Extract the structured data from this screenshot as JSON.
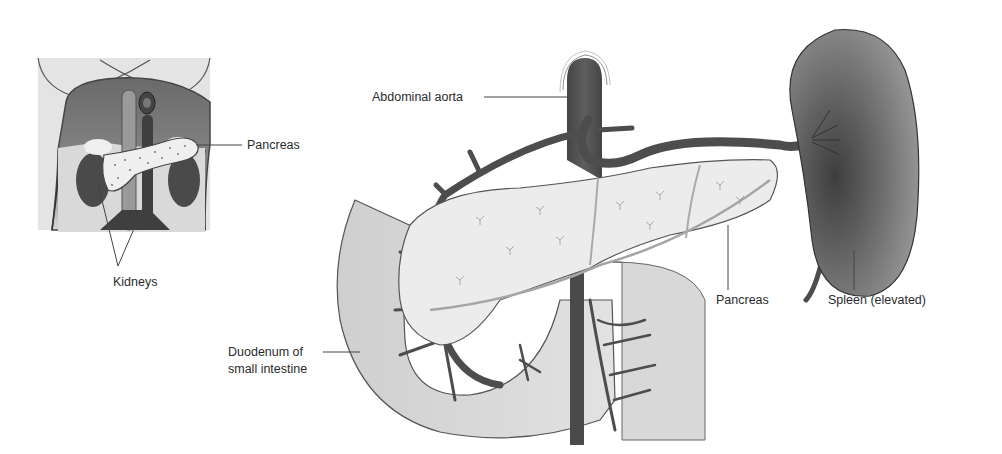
{
  "figure": {
    "inset": {
      "title": "Torso overview (posterior abdominal view)",
      "labels": {
        "pancreas": "Pancreas",
        "kidneys": "Kidneys"
      }
    },
    "main": {
      "labels": {
        "abdominal_aorta": "Abdominal aorta",
        "pancreas": "Pancreas",
        "spleen": "Spleen (elevated)",
        "duodenum_line1": "Duodenum of",
        "duodenum_line2": "small intestine"
      }
    },
    "colors": {
      "background": "#ffffff",
      "organ_dark": "#5a5a5a",
      "vessel": "#4d4d4d",
      "pancreas_fill": "#ebebeb",
      "duodenum_fill": "#d4d4d4",
      "spleen_fill": "#8a8a8a",
      "leader_line": "#444444",
      "text": "#2b2b2b"
    }
  }
}
